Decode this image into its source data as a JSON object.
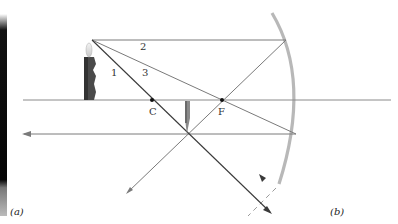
{
  "figure": {
    "panel_labels": {
      "a": "(a)",
      "b": "(b)"
    },
    "points": {
      "center_of_curvature": "C",
      "focal_point": "F"
    },
    "rays": [
      {
        "id": "1",
        "label": "1",
        "path": "through C, reflects back on itself"
      },
      {
        "id": "2",
        "label": "2",
        "path": "parallel to axis, reflects through F"
      },
      {
        "id": "3",
        "label": "3",
        "path": "through F, reflects parallel to axis"
      }
    ],
    "colors": {
      "ray": "#7a7a7a",
      "ray_dark": "#3a3a3a",
      "mirror": "#b5b5b5",
      "axis": "#8a8a8a",
      "candle": "#4a4a4a",
      "photo_strip": "#0a0a0a"
    }
  }
}
